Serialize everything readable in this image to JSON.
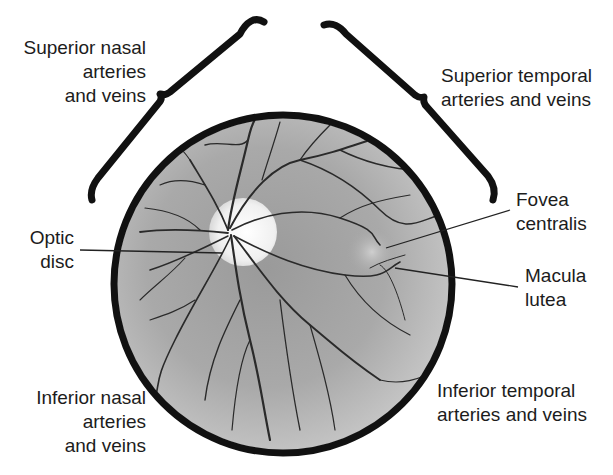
{
  "diagram": {
    "labels": {
      "superior_nasal": [
        "Superior nasal",
        "arteries",
        "and veins"
      ],
      "superior_temporal": [
        "Superior temporal",
        "arteries and veins"
      ],
      "optic_disc": [
        "Optic",
        "disc"
      ],
      "fovea_centralis": [
        "Fovea",
        "centralis"
      ],
      "macula_lutea": [
        "Macula",
        "lutea"
      ],
      "inferior_nasal": [
        "Inferior nasal",
        "arteries",
        "and veins"
      ],
      "inferior_temporal": [
        "Inferior temporal",
        "arteries and veins"
      ]
    },
    "colors": {
      "outline": "#111111",
      "fundus_fill": "#a8a8a8",
      "optic_disc": "#f2f2f2",
      "vessel": "#2a2a2a",
      "macula": "#c4c4c4"
    }
  }
}
